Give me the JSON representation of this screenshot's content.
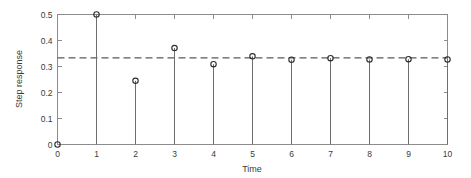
{
  "chart_data": {
    "type": "scatter",
    "plot_style": "stem",
    "title": "",
    "xlabel": "Time",
    "ylabel": "Step response",
    "x": [
      0,
      1,
      2,
      3,
      4,
      5,
      6,
      7,
      8,
      9,
      10
    ],
    "values": [
      0,
      0.5,
      0.245,
      0.371,
      0.309,
      0.339,
      0.326,
      0.332,
      0.327,
      0.328,
      0.327
    ],
    "series": [
      {
        "name": "Step response",
        "values": [
          0,
          0.5,
          0.245,
          0.371,
          0.309,
          0.339,
          0.326,
          0.332,
          0.327,
          0.328,
          0.327
        ]
      }
    ],
    "xlim": [
      0,
      10
    ],
    "ylim": [
      0,
      0.5
    ],
    "xticks": [
      0,
      1,
      2,
      3,
      4,
      5,
      6,
      7,
      8,
      9,
      10
    ],
    "xticklabels": [
      "0",
      "1",
      "2",
      "3",
      "4",
      "5",
      "6",
      "7",
      "8",
      "9",
      "10"
    ],
    "yticks": [
      0,
      0.1,
      0.2,
      0.3,
      0.4,
      0.5
    ],
    "yticklabels": [
      "0",
      "0.1",
      "0.2",
      "0.3",
      "0.4",
      "0.5"
    ],
    "grid": false,
    "legend": null,
    "legend_position": "none",
    "annotations": [
      {
        "kind": "reference-line",
        "orientation": "horizontal",
        "value": 0.3333,
        "style": "dashed",
        "label": ""
      }
    ],
    "marker_style": "open-circle",
    "colors": {
      "axis": "#8c8c8c",
      "stem": "#6e6e6e",
      "marker": "#2b2b2b",
      "reference_line": "#5a5a5a",
      "text": "#3a3a3a",
      "background": "#ffffff"
    }
  }
}
